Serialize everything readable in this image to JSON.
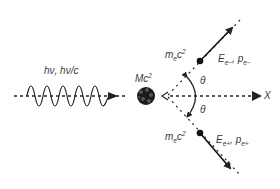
{
  "diagram": {
    "type": "pair-production",
    "photon_label": "hν, hν/c",
    "nucleus_label": "Mc",
    "nucleus_label_sup": "2",
    "electron_rest_label": "m",
    "electron_rest_sub": "e",
    "electron_rest_mid": "c",
    "electron_rest_sup": "2",
    "positron_rest_label": "m",
    "positron_rest_sub": "e",
    "positron_rest_mid": "c",
    "positron_rest_sup": "2",
    "electron_energy": "E",
    "electron_energy_sub": "e−",
    "electron_momentum": "p",
    "electron_momentum_sub": "e−",
    "positron_energy": "E",
    "positron_energy_sub": "e+",
    "positron_momentum": "p",
    "positron_momentum_sub": "e+",
    "theta_upper": "θ",
    "theta_lower": "θ",
    "axis_label": "X",
    "colors": {
      "ink": "#222222",
      "text": "#3a3a3a"
    }
  }
}
